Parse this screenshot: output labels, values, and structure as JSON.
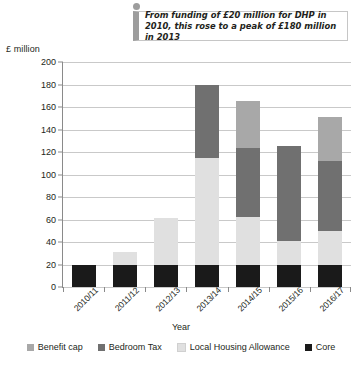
{
  "callout": {
    "text": "From funding of £20 million for DHP in 2010, this rose to a peak of £180 million in 2013"
  },
  "chart_data": {
    "type": "bar",
    "subtype": "stacked-bar",
    "title": "",
    "xlabel": "Year",
    "ylabel": "£ million",
    "ylim": [
      0,
      200
    ],
    "ytick_step": 20,
    "yticks": [
      200,
      180,
      160,
      140,
      120,
      100,
      80,
      60,
      40,
      20,
      0
    ],
    "grid": true,
    "legend_position": "bottom",
    "categories": [
      "2010/11",
      "2011/12",
      "2012/13",
      "2013/14",
      "2014/15",
      "2015/16",
      "2016/17"
    ],
    "series": [
      {
        "name": "Core",
        "color": "#1a1a1a",
        "values": [
          20,
          20,
          20,
          20,
          20,
          20,
          20
        ]
      },
      {
        "name": "Local Housing Allowance",
        "color": "#e0e0e0",
        "values": [
          0,
          11,
          41,
          95,
          42,
          21,
          30
        ]
      },
      {
        "name": "Bedroom Tax",
        "color": "#707070",
        "values": [
          0,
          0,
          0,
          65,
          62,
          84,
          62
        ]
      },
      {
        "name": "Benefit cap",
        "color": "#a8a8a8",
        "values": [
          0,
          0,
          0,
          0,
          41,
          0,
          39
        ]
      }
    ],
    "totals": [
      20,
      31,
      61,
      180,
      165,
      125,
      151
    ],
    "legend": [
      {
        "label": "Benefit cap",
        "color": "#a8a8a8"
      },
      {
        "label": "Bedroom Tax",
        "color": "#707070"
      },
      {
        "label": "Local Housing Allowance",
        "color": "#e0e0e0"
      },
      {
        "label": "Core",
        "color": "#1a1a1a"
      }
    ]
  }
}
